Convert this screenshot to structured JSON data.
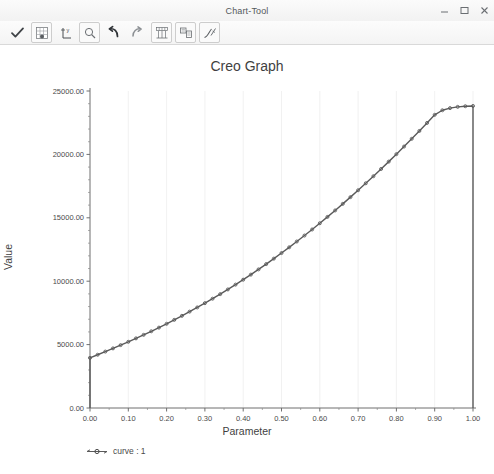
{
  "window": {
    "title": "Chart-Tool",
    "controls": [
      {
        "name": "minimize-button",
        "icon": "minimize-icon",
        "label": "Minimize"
      },
      {
        "name": "maximize-button",
        "icon": "maximize-icon",
        "label": "Maximize"
      },
      {
        "name": "close-button",
        "icon": "close-icon",
        "label": "Close"
      }
    ]
  },
  "toolbar": {
    "buttons": [
      {
        "name": "accept-button",
        "icon": "checkmark-icon",
        "label": "Accept"
      },
      {
        "name": "show-table-button",
        "icon": "table-grid-icon",
        "label": "Show Table"
      },
      {
        "name": "graph-settings-button",
        "icon": "axis-format-icon",
        "label": "Format Axis"
      },
      {
        "name": "zoom-button",
        "icon": "magnifier-icon",
        "label": "Zoom"
      },
      {
        "name": "undo-button",
        "icon": "undo-arrow-icon",
        "label": "Undo"
      },
      {
        "name": "redo-button",
        "icon": "redo-arrow-icon",
        "label": "Redo"
      },
      {
        "name": "grid-layout-button",
        "icon": "chart-grid-icon",
        "label": "Grid"
      },
      {
        "name": "legend-button",
        "icon": "legend-box-icon",
        "label": "Legend"
      },
      {
        "name": "curve-style-button",
        "icon": "curve-style-icon",
        "label": "Curve Style"
      }
    ]
  },
  "chart_data": {
    "type": "line",
    "title": "Creo Graph",
    "xlabel": "Parameter",
    "ylabel": "Value",
    "xlim": [
      0.0,
      1.0
    ],
    "ylim": [
      0.0,
      25000.0
    ],
    "grid": true,
    "legend_position": "bottom-left",
    "xtick_labels": [
      "0.00",
      "0.10",
      "0.20",
      "0.30",
      "0.40",
      "0.50",
      "0.60",
      "0.70",
      "0.80",
      "0.90",
      "1.00"
    ],
    "xticks": [
      0.0,
      0.1,
      0.2,
      0.3,
      0.4,
      0.5,
      0.6,
      0.7,
      0.8,
      0.9,
      1.0
    ],
    "ytick_labels": [
      "0.00",
      "5000.00",
      "10000.00",
      "15000.00",
      "20000.00",
      "25000.00"
    ],
    "yticks": [
      0,
      5000,
      10000,
      15000,
      20000,
      25000
    ],
    "x_minor_step": 0.02,
    "y_minor_step": 1000,
    "series": [
      {
        "name": "curve : 1",
        "color": "#5a5a5a",
        "marker": "circle",
        "x": [
          0.0,
          0.0,
          0.02,
          0.04,
          0.06,
          0.08,
          0.1,
          0.12,
          0.14,
          0.16,
          0.18,
          0.2,
          0.22,
          0.24,
          0.26,
          0.28,
          0.3,
          0.32,
          0.34,
          0.36,
          0.38,
          0.4,
          0.42,
          0.44,
          0.46,
          0.48,
          0.5,
          0.52,
          0.54,
          0.56,
          0.58,
          0.6,
          0.62,
          0.64,
          0.66,
          0.68,
          0.7,
          0.72,
          0.74,
          0.76,
          0.78,
          0.8,
          0.82,
          0.84,
          0.86,
          0.88,
          0.9,
          0.92,
          0.94,
          0.96,
          0.98,
          1.0,
          1.0
        ],
        "y": [
          0,
          3950,
          4200,
          4450,
          4700,
          4960,
          5220,
          5490,
          5770,
          6050,
          6340,
          6640,
          6950,
          7270,
          7600,
          7930,
          8270,
          8620,
          8980,
          9350,
          9730,
          10120,
          10520,
          10930,
          11350,
          11780,
          12220,
          12670,
          13130,
          13600,
          14080,
          14570,
          15070,
          15580,
          16100,
          16630,
          17170,
          17720,
          18280,
          18850,
          19430,
          20020,
          20620,
          21230,
          21850,
          22480,
          23120,
          23480,
          23650,
          23750,
          23800,
          23820,
          0
        ]
      }
    ]
  },
  "legend": {
    "entry_label": "curve : 1"
  }
}
